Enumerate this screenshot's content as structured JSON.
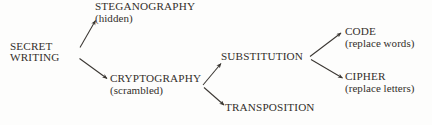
{
  "diagram": {
    "background_color": "#fdfdfc",
    "text_color": "#332f2b",
    "line_color": "#3a3632",
    "nodes": {
      "secret_writing": {
        "main": "SECRET",
        "main2": "WRITING",
        "sub": ""
      },
      "steganography": {
        "main": "STEGANOGRAPHY",
        "sub": "(hidden)"
      },
      "cryptography": {
        "main": "CRYPTOGRAPHY",
        "sub": "(scrambled)"
      },
      "substitution": {
        "main": "SUBSTITUTION",
        "sub": ""
      },
      "transposition": {
        "main": "TRANSPOSITION",
        "sub": ""
      },
      "code": {
        "main": "CODE",
        "sub": "(replace words)"
      },
      "cipher": {
        "main": "CIPHER",
        "sub": "(replace letters)"
      }
    },
    "edges": [
      {
        "name": "secret-writing-to-steganography",
        "from": "secret_writing",
        "to": "steganography"
      },
      {
        "name": "secret-writing-to-cryptography",
        "from": "secret_writing",
        "to": "cryptography"
      },
      {
        "name": "cryptography-to-substitution",
        "from": "cryptography",
        "to": "substitution"
      },
      {
        "name": "cryptography-to-transposition",
        "from": "cryptography",
        "to": "transposition"
      },
      {
        "name": "substitution-to-code",
        "from": "substitution",
        "to": "code"
      },
      {
        "name": "substitution-to-cipher",
        "from": "substitution",
        "to": "cipher"
      }
    ]
  }
}
